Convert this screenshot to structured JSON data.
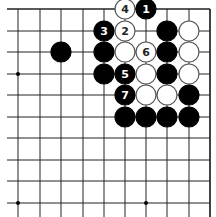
{
  "diagram": {
    "type": "go-board-fragment",
    "grid": {
      "columns_x": [
        18,
        40,
        61,
        83,
        104,
        125,
        146,
        167,
        189,
        210
      ],
      "rows_y": [
        9,
        31,
        52,
        74,
        95,
        117,
        138,
        160,
        181,
        203
      ],
      "line_start_x": 7,
      "right_edge_x": 210,
      "top_edge_y": 9,
      "line_end_y": 217,
      "line_color": "#222222"
    },
    "star_points": [
      {
        "col": 0,
        "row": 3
      },
      {
        "col": 0,
        "row": 9
      },
      {
        "col": 6,
        "row": 9
      }
    ],
    "stone_radius": 10,
    "colors": {
      "black": "#000000",
      "white": "#ffffff",
      "white_outline": "#555555"
    },
    "stones": [
      {
        "col": 5,
        "row": 0,
        "color": "white",
        "label": "4"
      },
      {
        "col": 6,
        "row": 0,
        "color": "black",
        "label": "1"
      },
      {
        "col": 4,
        "row": 1,
        "color": "black",
        "label": "3"
      },
      {
        "col": 5,
        "row": 1,
        "color": "white",
        "label": "2"
      },
      {
        "col": 7,
        "row": 1,
        "color": "black",
        "label": ""
      },
      {
        "col": 8,
        "row": 1,
        "color": "white",
        "label": ""
      },
      {
        "col": 2,
        "row": 2,
        "color": "black",
        "label": ""
      },
      {
        "col": 4,
        "row": 2,
        "color": "black",
        "label": ""
      },
      {
        "col": 5,
        "row": 2,
        "color": "white",
        "label": ""
      },
      {
        "col": 6,
        "row": 2,
        "color": "white",
        "label": "6"
      },
      {
        "col": 7,
        "row": 2,
        "color": "black",
        "label": ""
      },
      {
        "col": 8,
        "row": 2,
        "color": "white",
        "label": ""
      },
      {
        "col": 4,
        "row": 3,
        "color": "black",
        "label": ""
      },
      {
        "col": 5,
        "row": 3,
        "color": "black",
        "label": "5"
      },
      {
        "col": 6,
        "row": 3,
        "color": "white",
        "label": ""
      },
      {
        "col": 7,
        "row": 3,
        "color": "black",
        "label": ""
      },
      {
        "col": 8,
        "row": 3,
        "color": "white",
        "label": ""
      },
      {
        "col": 5,
        "row": 4,
        "color": "black",
        "label": "7"
      },
      {
        "col": 6,
        "row": 4,
        "color": "white",
        "label": ""
      },
      {
        "col": 7,
        "row": 4,
        "color": "white",
        "label": ""
      },
      {
        "col": 8,
        "row": 4,
        "color": "black",
        "label": ""
      },
      {
        "col": 5,
        "row": 5,
        "color": "black",
        "label": ""
      },
      {
        "col": 6,
        "row": 5,
        "color": "black",
        "label": ""
      },
      {
        "col": 7,
        "row": 5,
        "color": "black",
        "label": ""
      },
      {
        "col": 8,
        "row": 5,
        "color": "black",
        "label": ""
      }
    ]
  }
}
